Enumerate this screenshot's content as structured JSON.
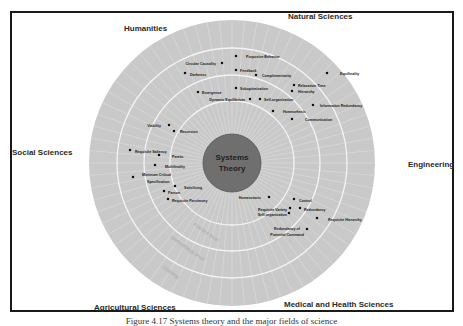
{
  "center": {
    "line1": "Systems",
    "line2": "Theory"
  },
  "fields": [
    {
      "label": "Humanities",
      "x": 124,
      "y": 24
    },
    {
      "label": "Natural Sciences",
      "x": 288,
      "y": 12
    },
    {
      "label": "Social Sciences",
      "x": 12,
      "y": 148
    },
    {
      "label": "Engineering",
      "x": 408,
      "y": 160
    },
    {
      "label": "Agricultural Sciences",
      "x": 94,
      "y": 303
    },
    {
      "label": "Medical and Health Sciences",
      "x": 284,
      "y": 300
    }
  ],
  "concepts": [
    {
      "label": "Purposive Behavior",
      "dx": 236,
      "dy": 56,
      "tx": 246,
      "ty": 58,
      "anchor": "start"
    },
    {
      "label": "Circular Causality",
      "dx": 222,
      "dy": 63,
      "tx": 216,
      "ty": 65,
      "anchor": "end"
    },
    {
      "label": "Darkness",
      "dx": 185,
      "dy": 73,
      "tx": 190,
      "ty": 76,
      "anchor": "start"
    },
    {
      "label": "Feedback",
      "dx": 236,
      "dy": 70,
      "tx": 240,
      "ty": 72,
      "anchor": "start"
    },
    {
      "label": "Complementarity",
      "dx": 256,
      "dy": 75,
      "tx": 262,
      "ty": 77,
      "anchor": "start"
    },
    {
      "label": "Equifinality",
      "dx": 327,
      "dy": 73,
      "tx": 340,
      "ty": 75,
      "anchor": "start"
    },
    {
      "label": "Relaxation Time",
      "dx": 294,
      "dy": 85,
      "tx": 298,
      "ty": 87,
      "anchor": "start"
    },
    {
      "label": "Hierarchy",
      "dx": 292,
      "dy": 91,
      "tx": 298,
      "ty": 93,
      "anchor": "start"
    },
    {
      "label": "Suboptimization",
      "dx": 236,
      "dy": 88,
      "tx": 240,
      "ty": 90,
      "anchor": "start"
    },
    {
      "label": "Emergence",
      "dx": 198,
      "dy": 92,
      "tx": 202,
      "ty": 94,
      "anchor": "start"
    },
    {
      "label": "Dynamic Equilibrium",
      "dx": 250,
      "dy": 99,
      "tx": 245,
      "ty": 101,
      "anchor": "end"
    },
    {
      "label": "Self-organization",
      "dx": 260,
      "dy": 99,
      "tx": 264,
      "ty": 101,
      "anchor": "start"
    },
    {
      "label": "Information Redundancy",
      "dx": 313,
      "dy": 105,
      "tx": 320,
      "ty": 107,
      "anchor": "start"
    },
    {
      "label": "Homeorhesis",
      "dx": 273,
      "dy": 111,
      "tx": 283,
      "ty": 113,
      "anchor": "start"
    },
    {
      "label": "Communication",
      "dx": 292,
      "dy": 119,
      "tx": 305,
      "ty": 121,
      "anchor": "start"
    },
    {
      "label": "Viability",
      "dx": 169,
      "dy": 125,
      "tx": 161,
      "ty": 127,
      "anchor": "end"
    },
    {
      "label": "Recursion",
      "dx": 174,
      "dy": 131,
      "tx": 180,
      "ty": 133,
      "anchor": "start"
    },
    {
      "label": "Requisite Saliency",
      "dx": 130,
      "dy": 150,
      "tx": 135,
      "ty": 153,
      "anchor": "start"
    },
    {
      "label": "Pareto",
      "dx": 159,
      "dy": 155,
      "tx": 172,
      "ty": 158,
      "anchor": "start"
    },
    {
      "label": "Multifinality",
      "dx": 155,
      "dy": 165,
      "tx": 165,
      "ty": 168,
      "anchor": "start"
    },
    {
      "label": "Minimum Critical",
      "dx": 133,
      "dy": 177,
      "tx": 142,
      "ty": 176,
      "anchor": "start"
    },
    {
      "label": "Specification",
      "dx": null,
      "dy": null,
      "tx": 147,
      "ty": 183,
      "anchor": "start"
    },
    {
      "label": "Satisficing",
      "dx": 175,
      "dy": 186,
      "tx": 184,
      "ty": 189,
      "anchor": "start"
    },
    {
      "label": "Parson",
      "dx": 164,
      "dy": 191,
      "tx": 168,
      "ty": 194,
      "anchor": "start"
    },
    {
      "label": "Requisite Parsimony",
      "dx": 168,
      "dy": 199,
      "tx": 172,
      "ty": 202,
      "anchor": "start"
    },
    {
      "label": "Homeostasis",
      "dx": 269,
      "dy": 197,
      "tx": 261,
      "ty": 199,
      "anchor": "end"
    },
    {
      "label": "Control",
      "dx": 294,
      "dy": 199,
      "tx": 299,
      "ty": 202,
      "anchor": "start"
    },
    {
      "label": "Requisite Variety",
      "dx": 290,
      "dy": 208,
      "tx": 287,
      "ty": 211,
      "anchor": "end"
    },
    {
      "label": "Redundancy",
      "dx": 300,
      "dy": 208,
      "tx": 304,
      "ty": 211,
      "anchor": "start"
    },
    {
      "label": "Self-organization",
      "dx": 289,
      "dy": 213,
      "tx": 287,
      "ty": 216,
      "anchor": "end"
    },
    {
      "label": "Requisite Hierarchy",
      "dx": 317,
      "dy": 218,
      "tx": 328,
      "ty": 221,
      "anchor": "start"
    },
    {
      "label": "Redundancy of",
      "dx": null,
      "dy": null,
      "tx": 300,
      "ty": 230,
      "anchor": "end"
    },
    {
      "label": "Potential Command",
      "dx": 307,
      "dy": 229,
      "tx": 304,
      "ty": 236,
      "anchor": "end"
    }
  ],
  "ring_labels": [
    {
      "label": "Practice level",
      "x": 193,
      "y": 225,
      "rotate": 35
    },
    {
      "label": "Methodology level",
      "x": 170,
      "y": 238,
      "rotate": 35
    },
    {
      "label": "Ontology",
      "x": 162,
      "y": 268,
      "rotate": 35
    }
  ],
  "caption": "Figure 4.17   Systems theory and the major fields of science"
}
